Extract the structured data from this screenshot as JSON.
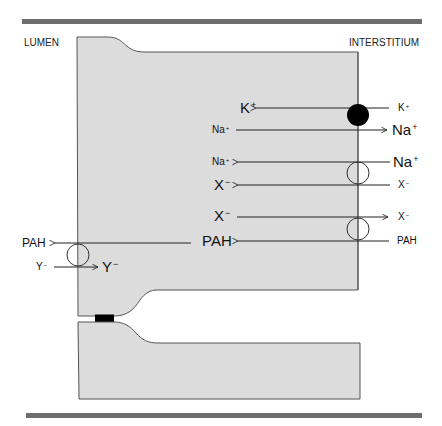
{
  "regions": {
    "left": "LUMEN",
    "right": "INTERSTITIUM"
  },
  "colors": {
    "cell_fill": "#dcdcdc",
    "cell_stroke": "#555555",
    "bar": "#6e6e6e",
    "line": "#222222",
    "pump": "#000000",
    "junction": "#000000"
  },
  "transport": {
    "basolateral": [
      {
        "id": "pump-k",
        "inside": {
          "ion": "K",
          "charge": "+"
        },
        "outside": {
          "ion": "K",
          "charge": "+"
        },
        "direction": "in",
        "carrier": "pump"
      },
      {
        "id": "pump-na",
        "inside": {
          "ion": "Na",
          "charge": "+"
        },
        "outside": {
          "ion": "Na",
          "charge": "+"
        },
        "direction": "out",
        "carrier": "pump"
      },
      {
        "id": "cotrans-na",
        "inside": {
          "ion": "Na",
          "charge": "+"
        },
        "outside": {
          "ion": "Na",
          "charge": "+"
        },
        "direction": "in",
        "carrier": "exchanger-1"
      },
      {
        "id": "cotrans-x",
        "inside": {
          "ion": "X",
          "charge": "−"
        },
        "outside": {
          "ion": "X",
          "charge": "−"
        },
        "direction": "in",
        "carrier": "exchanger-1"
      },
      {
        "id": "exch-x",
        "inside": {
          "ion": "X",
          "charge": "−"
        },
        "outside": {
          "ion": "X",
          "charge": "−"
        },
        "direction": "out",
        "carrier": "exchanger-2"
      },
      {
        "id": "exch-pah",
        "inside": {
          "ion": "PAH",
          "charge": ""
        },
        "outside": {
          "ion": "PAH",
          "charge": ""
        },
        "direction": "in",
        "carrier": "exchanger-2"
      }
    ],
    "apical": [
      {
        "id": "apical-pah",
        "inside": {
          "ion": "PAH",
          "charge": ""
        },
        "outside": {
          "ion": "PAH",
          "charge": ""
        },
        "direction": "out"
      },
      {
        "id": "apical-y",
        "inside": {
          "ion": "Y",
          "charge": "−"
        },
        "outside": {
          "ion": "Y",
          "charge": "−"
        },
        "direction": "in"
      }
    ]
  }
}
